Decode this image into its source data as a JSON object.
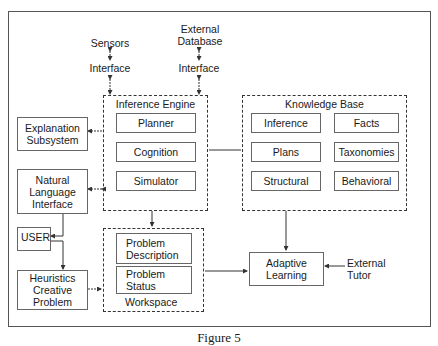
{
  "diagram": {
    "caption": "Figure 5",
    "external": {
      "sensors": "Sensors",
      "sensors_interface": "Interface",
      "database": "External\nDatabase",
      "database_interface": "Interface",
      "external_tutor": "External\nTutor"
    },
    "inference_engine": {
      "title": "Inference Engine",
      "modules": [
        "Planner",
        "Cognition",
        "Simulator"
      ]
    },
    "knowledge_base": {
      "title": "Knowledge Base",
      "modules": [
        "Inference",
        "Facts",
        "Plans",
        "Taxonomies",
        "Structural",
        "Behavioral"
      ]
    },
    "workspace": {
      "title": "Workspace",
      "modules": [
        "Problem\nDescription",
        "Problem\nStatus"
      ]
    },
    "left_column": {
      "explanation": "Explanation\nSubsystem",
      "nli": "Natural\nLanguage\nInterface",
      "user": "USER",
      "heuristics": "Heuristics\nCreative\nProblem"
    },
    "adaptive_learning": "Adaptive\nLearning",
    "colors": {
      "line": "#333333",
      "box_border": "#666666",
      "background": "#ffffff"
    }
  }
}
